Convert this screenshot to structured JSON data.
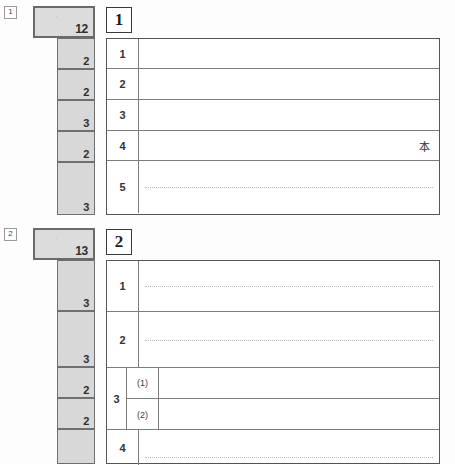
{
  "document": {
    "type": "answer-sheet",
    "background_color": "#fdfdfd",
    "score_box_color": "#d8d8d8"
  },
  "sections": [
    {
      "marker_label": "1",
      "number_label": "1",
      "total_score": "12",
      "score_boxes": [
        {
          "denominator": "12",
          "is_total": true
        },
        {
          "denominator": "2"
        },
        {
          "denominator": "2"
        },
        {
          "denominator": "3"
        },
        {
          "denominator": "2"
        },
        {
          "denominator": "3"
        }
      ],
      "rows": [
        {
          "number": "1",
          "answer": "",
          "guide_line": false,
          "unit": ""
        },
        {
          "number": "2",
          "answer": "",
          "guide_line": false,
          "unit": ""
        },
        {
          "number": "3",
          "answer": "",
          "guide_line": false,
          "unit": ""
        },
        {
          "number": "4",
          "answer": "",
          "guide_line": false,
          "unit": "本"
        },
        {
          "number": "5",
          "answer": "",
          "guide_line": true,
          "unit": ""
        }
      ]
    },
    {
      "marker_label": "2",
      "number_label": "2",
      "total_score": "13",
      "score_boxes": [
        {
          "denominator": "13",
          "is_total": true
        },
        {
          "denominator": "3"
        },
        {
          "denominator": "3"
        },
        {
          "denominator": "2"
        },
        {
          "denominator": "2"
        },
        {
          "denominator": ""
        }
      ],
      "rows": [
        {
          "number": "1",
          "answer": "",
          "guide_line": true,
          "unit": ""
        },
        {
          "number": "2",
          "answer": "",
          "guide_line": true,
          "unit": ""
        },
        {
          "number": "3",
          "subrows": [
            {
              "label": "(1)",
              "answer": ""
            },
            {
              "label": "(2)",
              "answer": ""
            }
          ]
        },
        {
          "number": "4",
          "answer": "",
          "guide_line": true,
          "unit": ""
        }
      ]
    }
  ]
}
